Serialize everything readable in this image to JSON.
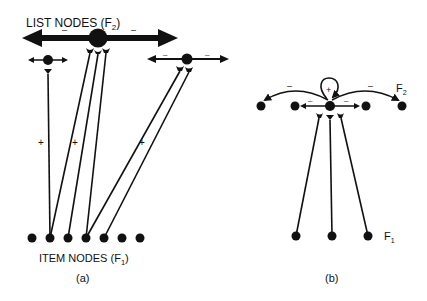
{
  "labels": {
    "list_nodes": "LIST NODES (F",
    "list_nodes_sub": "2",
    "list_nodes_close": ")",
    "item_nodes": "ITEM NODES (F",
    "item_nodes_sub": "1",
    "item_nodes_close": ")",
    "panel_a": "(a)",
    "panel_b": "(b)",
    "f2": "F",
    "f2_sub": "2",
    "f1": "F",
    "f1_sub": "1",
    "plus": "+",
    "minus": "–"
  },
  "colors": {
    "ink": "#111111",
    "background": "#ffffff"
  },
  "panel_a": {
    "item_nodes_x": [
      32,
      50,
      68,
      86,
      104,
      122,
      140
    ],
    "item_nodes_y": 238,
    "list_nodes": [
      {
        "id": "small-left",
        "x": 48,
        "y": 60,
        "r": 5
      },
      {
        "id": "large-center",
        "x": 98,
        "y": 38,
        "r": 9
      },
      {
        "id": "medium-right",
        "x": 187,
        "y": 59,
        "r": 5
      }
    ]
  },
  "panel_b": {
    "f2_nodes_x": [
      261,
      295,
      330,
      366,
      402
    ],
    "f2_nodes_y": 106,
    "f1_nodes_x": [
      296,
      332,
      368
    ],
    "f1_nodes_y": 236
  }
}
